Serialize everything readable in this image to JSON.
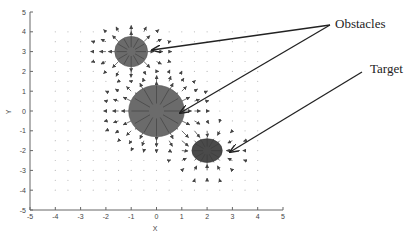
{
  "figure": {
    "xlabel": "X",
    "ylabel": "Y",
    "annotations": {
      "obstacles": "Obstacles",
      "target": "Target"
    }
  },
  "chart_data": {
    "type": "quiver",
    "title": "",
    "xlabel": "X",
    "ylabel": "Y",
    "xlim": [
      -5,
      5
    ],
    "ylim": [
      -5,
      5
    ],
    "xticks": [
      -5,
      -4,
      -3,
      -2,
      -1,
      0,
      1,
      2,
      3,
      4,
      5
    ],
    "yticks": [
      -5,
      -4,
      -3,
      -2,
      -1,
      0,
      1,
      2,
      3,
      4,
      5
    ],
    "grid": false,
    "vector_field": {
      "x_range": [
        -4,
        4
      ],
      "y_range": [
        -4,
        4
      ],
      "spacing": 0.5
    },
    "obstacles": [
      {
        "label": "Obstacle",
        "cx": -1,
        "cy": 3,
        "rx": 0.65,
        "ry": 0.65,
        "field": "repulsive"
      },
      {
        "label": "Obstacle",
        "cx": 0,
        "cy": 0,
        "rx": 1.1,
        "ry": 1.1,
        "field": "repulsive"
      }
    ],
    "target": {
      "label": "Target",
      "cx": 2,
      "cy": -2,
      "rx": 0.6,
      "ry": 0.6,
      "field": "attractive"
    },
    "annotations": [
      {
        "text": "Obstacles",
        "points_to": [
          [
            -1,
            3
          ],
          [
            0,
            0
          ]
        ]
      },
      {
        "text": "Target",
        "points_to": [
          [
            2,
            -2
          ]
        ]
      }
    ]
  },
  "colors": {
    "obstacle_fill": "#6b6b6b",
    "target_fill": "#4a4a4a",
    "axis": "#555555",
    "arrow": "#333333",
    "grid_dot": "#bbbbbb"
  }
}
